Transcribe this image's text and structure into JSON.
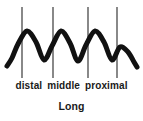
{
  "figure": {
    "title": "Long",
    "segment_labels": [
      "distal",
      "middle",
      "proximal"
    ],
    "background_color": "#ffffff",
    "wave_color": "#111111",
    "divider_color": "#3a3a3a",
    "text_color": "#1a1a1a"
  },
  "chart_data": {
    "type": "line",
    "title": "Long",
    "xlabel": "",
    "ylabel": "",
    "grid": false,
    "legend": null,
    "axis_visible": false,
    "xlim": [
      0,
      143
    ],
    "ylim": [
      80,
      0
    ],
    "series": [
      {
        "name": "wave",
        "stroke_width": 5,
        "points": [
          [
            7,
            66
          ],
          [
            12,
            58
          ],
          [
            18,
            44
          ],
          [
            27,
            31
          ],
          [
            36,
            42
          ],
          [
            44,
            60
          ],
          [
            52,
            46
          ],
          [
            61,
            31
          ],
          [
            70,
            43
          ],
          [
            78,
            61
          ],
          [
            86,
            45
          ],
          [
            95,
            31
          ],
          [
            104,
            42
          ],
          [
            112,
            60
          ],
          [
            120,
            47
          ],
          [
            128,
            52
          ],
          [
            134,
            62
          ],
          [
            137,
            67
          ]
        ]
      }
    ],
    "annotations": [
      {
        "type": "vline",
        "x": 22,
        "y0": 7,
        "y1": 78
      },
      {
        "type": "vline",
        "x": 53,
        "y0": 7,
        "y1": 78
      },
      {
        "type": "vline",
        "x": 88,
        "y0": 7,
        "y1": 78
      },
      {
        "type": "vline",
        "x": 117,
        "y0": 7,
        "y1": 78
      }
    ],
    "tick_labels": [
      "distal",
      "middle",
      "proximal"
    ]
  }
}
